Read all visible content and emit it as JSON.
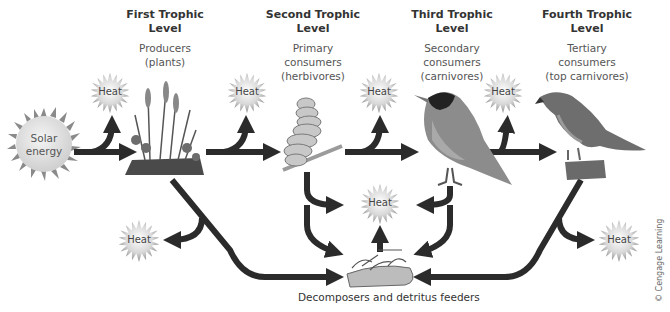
{
  "levels": [
    {
      "title": "First Trophic Level",
      "title_line1": "First Trophic",
      "title_line2": "Level",
      "desc_line1": "Producers",
      "desc_line2": "(plants)",
      "desc_line3": ""
    },
    {
      "title": "Second Trophic Level",
      "title_line1": "Second Trophic",
      "title_line2": "Level",
      "desc_line1": "Primary",
      "desc_line2": "consumers",
      "desc_line3": "(herbivores)"
    },
    {
      "title": "Third Trophic Level",
      "title_line1": "Third Trophic",
      "title_line2": "Level",
      "desc_line1": "Secondary",
      "desc_line2": "consumers",
      "desc_line3": "(carnivores)"
    },
    {
      "title": "Fourth Trophic Level",
      "title_line1": "Fourth Trophic",
      "title_line2": "Level",
      "desc_line1": "Tertiary",
      "desc_line2": "consumers",
      "desc_line3": "(top carnivores)"
    }
  ],
  "solar": {
    "line1": "Solar",
    "line2": "energy"
  },
  "heat_label": "Heat",
  "decomposers_label": "Decomposers and detritus feeders",
  "credit": "© Cengage Learning",
  "colors": {
    "arrow": "#2b2b2b",
    "heat_core": "#f2f2f2",
    "heat_ray": "#9a9a9a",
    "sun_body": "#e6e6e6",
    "sun_ray": "#888888"
  }
}
